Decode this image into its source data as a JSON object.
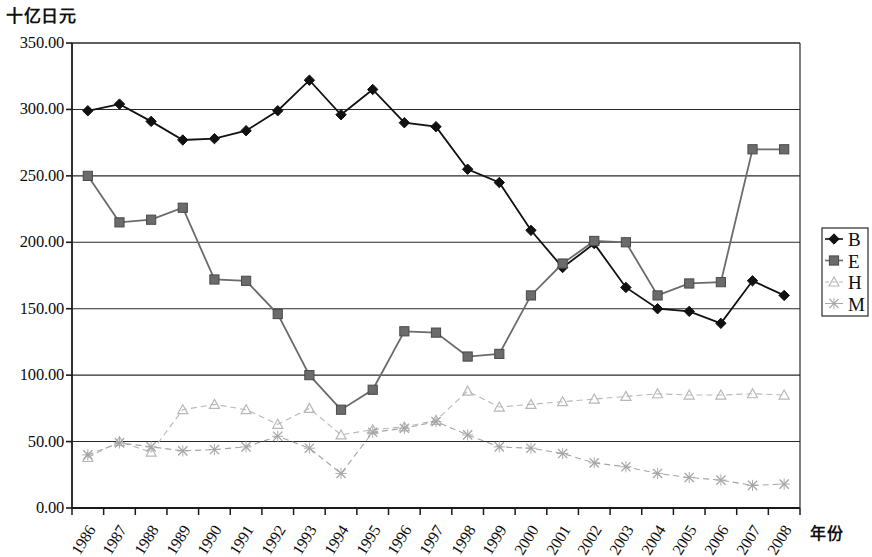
{
  "chart_data": {
    "type": "line",
    "title": "",
    "ylabel": "十亿日元",
    "xlabel": "年份",
    "ylim": [
      0,
      350
    ],
    "ytick_labels": [
      "350.00",
      "300.00",
      "250.00",
      "200.00",
      "150.00",
      "100.00",
      "50.00",
      "0.00"
    ],
    "ytick_values": [
      350,
      300,
      250,
      200,
      150,
      100,
      50,
      0
    ],
    "grid": true,
    "grid_axis": "y",
    "legend_position": "right",
    "categories": [
      "1986",
      "1987",
      "1988",
      "1989",
      "1990",
      "1991",
      "1992",
      "1993",
      "1994",
      "1995",
      "1996",
      "1997",
      "1998",
      "1999",
      "2000",
      "2001",
      "2002",
      "2003",
      "2004",
      "2005",
      "2006",
      "2007",
      "2008"
    ],
    "series": [
      {
        "name": "B",
        "marker": "diamond",
        "color": "#111111",
        "values": [
          299,
          304,
          291,
          277,
          278,
          284,
          299,
          322,
          296,
          315,
          290,
          287,
          255,
          245,
          209,
          181,
          199,
          166,
          150,
          148,
          139,
          171,
          160
        ]
      },
      {
        "name": "E",
        "marker": "square",
        "color": "#6b6b6b",
        "values": [
          250,
          215,
          217,
          226,
          172,
          171,
          146,
          100,
          74,
          89,
          133,
          132,
          114,
          116,
          160,
          184,
          201,
          200,
          160,
          169,
          170,
          270,
          270
        ]
      },
      {
        "name": "H",
        "marker": "triangle",
        "color": "#b8b8b8",
        "values": [
          38,
          50,
          42,
          74,
          78,
          74,
          63,
          75,
          55,
          59,
          61,
          66,
          88,
          76,
          78,
          80,
          82,
          84,
          86,
          85,
          85,
          86,
          85
        ]
      },
      {
        "name": "M",
        "marker": "x",
        "color": "#a5a5a5",
        "values": [
          40,
          49,
          46,
          43,
          44,
          46,
          54,
          45,
          26,
          57,
          60,
          65,
          55,
          46,
          45,
          41,
          34,
          31,
          26,
          23,
          21,
          17,
          18
        ]
      }
    ]
  },
  "legend": {
    "entries": [
      {
        "label": "B",
        "marker": "diamond"
      },
      {
        "label": "E",
        "marker": "square"
      },
      {
        "label": "H",
        "marker": "triangle"
      },
      {
        "label": "M",
        "marker": "x"
      }
    ]
  },
  "axes": {
    "y_title": "十亿日元",
    "x_title": "年份"
  }
}
